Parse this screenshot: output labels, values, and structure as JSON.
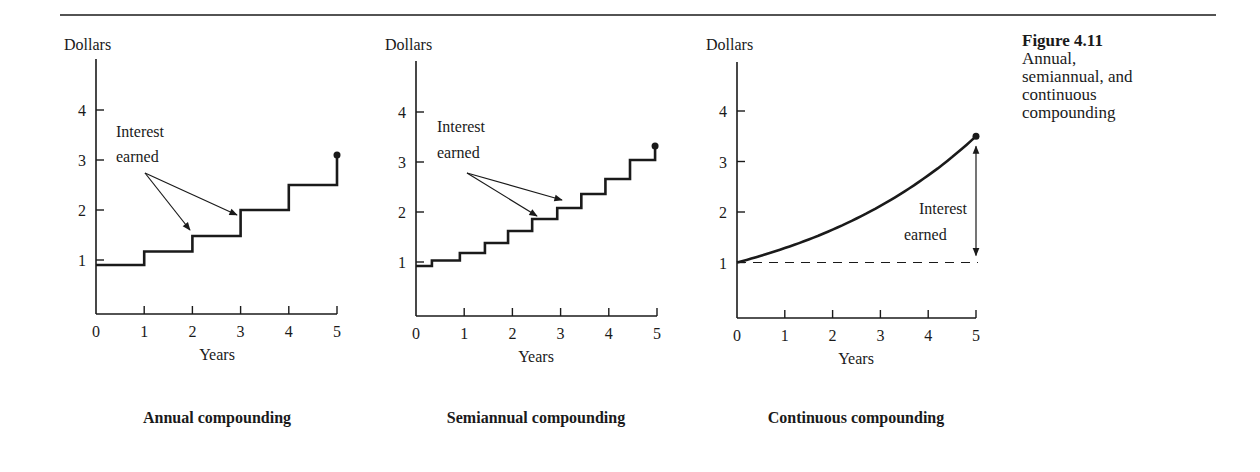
{
  "figure": {
    "number": "Figure 4.11",
    "caption_lines": [
      "Annual,",
      "semiannual, and",
      "continuous",
      "compounding"
    ]
  },
  "colors": {
    "ink": "#1a1a1a",
    "background": "#ffffff"
  },
  "chart_data": [
    {
      "type": "line",
      "style": "step",
      "title": "Annual compounding",
      "xlabel": "Years",
      "ylabel": "Dollars",
      "xlim": [
        0,
        5
      ],
      "ylim": [
        0,
        5
      ],
      "xticks": [
        0,
        1,
        2,
        3,
        4,
        5
      ],
      "yticks": [
        1,
        2,
        3,
        4
      ],
      "grid": false,
      "annotation": "Interest earned",
      "steps": [
        {
          "x0": 0,
          "x1": 1,
          "y": 0.9
        },
        {
          "x0": 1,
          "x1": 2,
          "y": 1.17
        },
        {
          "x0": 2,
          "x1": 3,
          "y": 1.48
        },
        {
          "x0": 3,
          "x1": 4,
          "y": 2.0
        },
        {
          "x0": 4,
          "x1": 5,
          "y": 2.5
        }
      ],
      "end_point": {
        "x": 5,
        "y": 3.1
      }
    },
    {
      "type": "line",
      "style": "step",
      "title": "Semiannual compounding",
      "xlabel": "Years",
      "ylabel": "Dollars",
      "xlim": [
        0,
        5
      ],
      "ylim": [
        0,
        5
      ],
      "xticks": [
        0,
        1,
        2,
        3,
        4,
        5
      ],
      "yticks": [
        1,
        2,
        3,
        4
      ],
      "grid": false,
      "annotation": "Interest earned",
      "steps": [
        {
          "x0": 0.0,
          "x1": 0.33,
          "y": 0.92
        },
        {
          "x0": 0.33,
          "x1": 0.91,
          "y": 1.03
        },
        {
          "x0": 0.91,
          "x1": 1.43,
          "y": 1.18
        },
        {
          "x0": 1.43,
          "x1": 1.91,
          "y": 1.38
        },
        {
          "x0": 1.91,
          "x1": 2.41,
          "y": 1.62
        },
        {
          "x0": 2.41,
          "x1": 2.93,
          "y": 1.86
        },
        {
          "x0": 2.93,
          "x1": 3.43,
          "y": 2.08
        },
        {
          "x0": 3.43,
          "x1": 3.93,
          "y": 2.36
        },
        {
          "x0": 3.93,
          "x1": 4.44,
          "y": 2.66
        },
        {
          "x0": 4.44,
          "x1": 4.96,
          "y": 3.04
        }
      ],
      "end_point": {
        "x": 4.96,
        "y": 3.32
      }
    },
    {
      "type": "line",
      "style": "curve",
      "title": "Continuous compounding",
      "xlabel": "Years",
      "ylabel": "Dollars",
      "xlim": [
        0,
        5
      ],
      "ylim": [
        0,
        5
      ],
      "xticks": [
        0,
        1,
        2,
        3,
        4,
        5
      ],
      "yticks": [
        1,
        2,
        3,
        4
      ],
      "grid": false,
      "annotation": "Interest earned",
      "x": [
        0,
        1,
        2,
        3,
        4,
        5
      ],
      "y": [
        1.0,
        1.28,
        1.65,
        2.12,
        2.72,
        3.5
      ],
      "baseline": 1.0,
      "end_point": {
        "x": 5,
        "y": 3.5
      }
    }
  ],
  "charts": [
    {
      "title": "Annual compounding",
      "ylabel": "Dollars",
      "xlabel": "Years",
      "annotation_line1": "Interest",
      "annotation_line2": "earned",
      "yticklabels": [
        "1",
        "2",
        "3",
        "4"
      ],
      "xticklabels": [
        "0",
        "1",
        "2",
        "3",
        "4",
        "5"
      ]
    },
    {
      "title": "Semiannual compounding",
      "ylabel": "Dollars",
      "xlabel": "Years",
      "annotation_line1": "Interest",
      "annotation_line2": "earned",
      "yticklabels": [
        "1",
        "2",
        "3",
        "4"
      ],
      "xticklabels": [
        "0",
        "1",
        "2",
        "3",
        "4",
        "5"
      ]
    },
    {
      "title": "Continuous compounding",
      "ylabel": "Dollars",
      "xlabel": "Years",
      "annotation_line1": "Interest",
      "annotation_line2": "earned",
      "yticklabels": [
        "1",
        "2",
        "3",
        "4"
      ],
      "xticklabels": [
        "0",
        "1",
        "2",
        "3",
        "4",
        "5"
      ]
    }
  ]
}
